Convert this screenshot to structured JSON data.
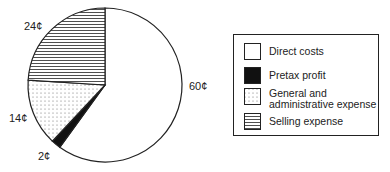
{
  "chart_data": {
    "type": "pie",
    "title": "",
    "unit": "¢",
    "categories": [
      "Direct costs",
      "Pretax profit",
      "General and administrative expense",
      "Selling expense"
    ],
    "values": [
      60,
      2,
      14,
      24
    ],
    "data_labels": [
      "60¢",
      "2¢",
      "14¢",
      "24¢"
    ],
    "patterns": [
      "white",
      "solid-black",
      "dots",
      "horizontal-lines"
    ],
    "legend_position": "right",
    "start_angle": "12 o'clock, clockwise"
  },
  "legend": {
    "items": [
      {
        "label": "Direct costs"
      },
      {
        "label": "Pretax profit"
      },
      {
        "label_line1": "General and",
        "label_line2": "administrative expense"
      },
      {
        "label": "Selling expense"
      }
    ]
  },
  "labels": {
    "direct": "60¢",
    "profit": "2¢",
    "ga": "14¢",
    "selling": "24¢"
  }
}
